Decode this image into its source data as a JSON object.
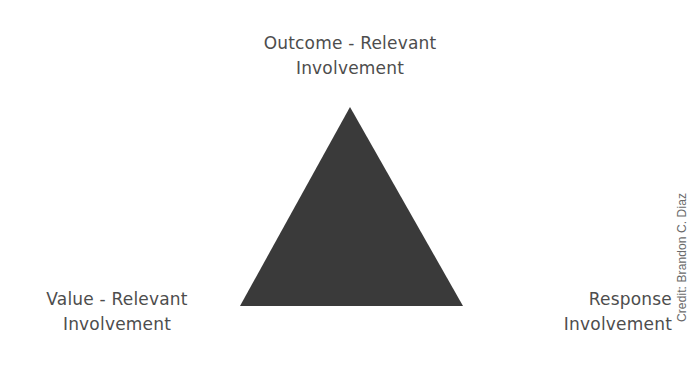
{
  "diagram": {
    "shape": "triangle",
    "fill_color": "#3a3a3a",
    "vertices": {
      "top": "Outcome - Relevant Involvement",
      "bottom_left": "Value - Relevant Involvement",
      "bottom_right": "Response Involvement"
    }
  },
  "labels": {
    "top": {
      "line1": "Outcome - Relevant",
      "line2": "Involvement"
    },
    "left": {
      "line1": "Value - Relevant",
      "line2": "Involvement"
    },
    "right": {
      "line1": "Response",
      "line2": "Involvement"
    }
  },
  "credit": "Credit: Brandon C. Diaz"
}
